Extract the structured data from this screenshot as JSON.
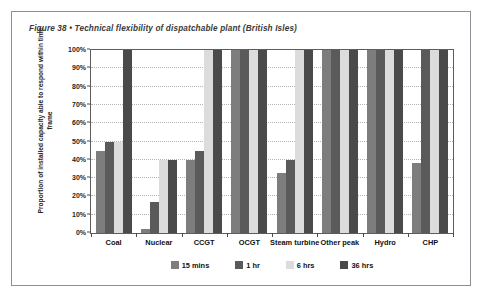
{
  "figure": {
    "title": "Figure 38  •  Technical flexibility of dispatchable plant (British Isles)"
  },
  "chart_data": {
    "type": "bar",
    "title": "Figure 38  •  Technical flexibility of dispatchable plant (British Isles)",
    "xlabel": "",
    "ylabel": "Proportion of installed capacity able to respond within time frame",
    "ylim": [
      0,
      100
    ],
    "yticks": [
      "0%",
      "10%",
      "20%",
      "30%",
      "40%",
      "50%",
      "60%",
      "70%",
      "80%",
      "90%",
      "100%"
    ],
    "ytick_values": [
      0,
      10,
      20,
      30,
      40,
      50,
      60,
      70,
      80,
      90,
      100
    ],
    "grid": true,
    "legend_position": "bottom",
    "categories": [
      "Coal",
      "Nuclear",
      "CCGT",
      "OCGT",
      "Steam turbine",
      "Other peak",
      "Hydro",
      "CHP"
    ],
    "series": [
      {
        "name": "15 mins",
        "color": "#7d7d7d",
        "values": [
          45,
          2,
          40,
          100,
          33,
          100,
          100,
          38
        ]
      },
      {
        "name": "1 hr",
        "color": "#5a5a5a",
        "values": [
          50,
          17,
          45,
          100,
          40,
          100,
          100,
          100
        ]
      },
      {
        "name": "6 hrs",
        "color": "#dcdcdc",
        "values": [
          50,
          40,
          100,
          100,
          100,
          100,
          100,
          100
        ]
      },
      {
        "name": "36 hrs",
        "color": "#4a4a4a",
        "values": [
          100,
          40,
          100,
          100,
          100,
          100,
          100,
          100
        ]
      }
    ]
  },
  "colors": {
    "frame_border": "#8c8f96",
    "plot_border": "#5d5d5d",
    "gridline": "#b4b4b4",
    "title_text": "#3a3a3a",
    "axis_text": "#111111",
    "background": "#ffffff"
  }
}
